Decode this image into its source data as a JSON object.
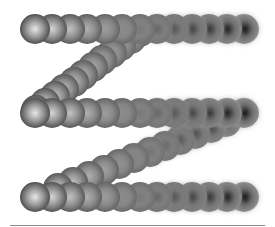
{
  "graphic": {
    "description": "Zigzag path of shaded spheres",
    "sphere_radius": 15,
    "background": "#ffffff",
    "rows": [
      {
        "name": "top-row",
        "y": 29,
        "x_start": 35,
        "x_end": 244,
        "count": 13
      },
      {
        "name": "middle-row",
        "y": 113,
        "x_start": 35,
        "x_end": 244,
        "count": 13
      },
      {
        "name": "bottom-row",
        "y": 197,
        "x_start": 35,
        "x_end": 244,
        "count": 13
      }
    ],
    "diagonals": [
      {
        "name": "upper-diagonal",
        "x1": 140,
        "y1": 32,
        "x2": 36,
        "y2": 110,
        "count": 12,
        "shade_start": 0.45,
        "shade_end": 0.08
      },
      {
        "name": "lower-diagonal",
        "x1": 226,
        "y1": 122,
        "x2": 58,
        "y2": 188,
        "count": 12,
        "shade_start": 0.85,
        "shade_end": 0.12
      }
    ],
    "shading": {
      "light_center": "#e8e8e8",
      "mid_tone": "#7a7a7a",
      "dark_edge": "#3a3a3a",
      "dark_center": "#0a0a0a"
    },
    "baseline": {
      "x1": 10,
      "x2": 265,
      "y": 225,
      "color": "#8a8a8a"
    }
  }
}
